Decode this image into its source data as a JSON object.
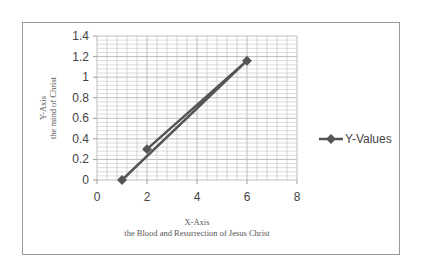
{
  "chart_data": {
    "type": "scatter",
    "mode": "lines+markers",
    "series": [
      {
        "name": "Y-Values",
        "x": [
          1,
          6,
          2
        ],
        "y": [
          0,
          1.16,
          0.3
        ],
        "color": "#555555"
      }
    ],
    "xlabel": "X-Axis",
    "xlabel_sub": "the Blood and Resurrection of Jesus Christ",
    "ylabel": "Y-Axis",
    "ylabel_sub": "the mind of Christ",
    "xlim": [
      0,
      8
    ],
    "ylim": [
      0,
      1.4
    ],
    "x_ticks": [
      "0",
      "2",
      "4",
      "6",
      "8"
    ],
    "y_ticks": [
      "0",
      "0.2",
      "0.4",
      "0.6",
      "0.8",
      "1",
      "1.2",
      "1.4"
    ],
    "grid": true,
    "minor_grid": true,
    "legend": {
      "position": "right",
      "entries": [
        "Y-Values"
      ]
    }
  },
  "colors": {
    "series": "#555555",
    "grid": "#b8b8b8",
    "border": "#9a9a9a"
  }
}
